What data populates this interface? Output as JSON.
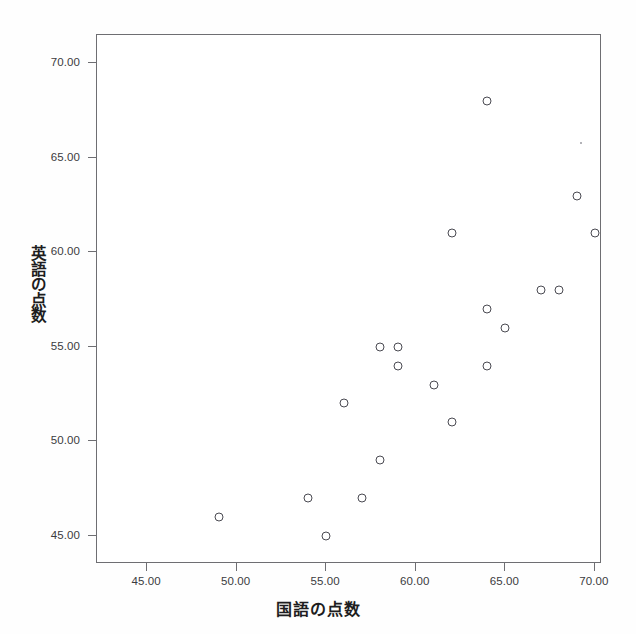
{
  "chart_data": {
    "type": "scatter",
    "title": "",
    "xlabel": "国語の点数",
    "ylabel": "英語の点数",
    "xlim": [
      42.2,
      70.4
    ],
    "ylim": [
      43.5,
      71.5
    ],
    "grid": false,
    "legend": null,
    "xticks": [
      "45.00",
      "50.00",
      "55.00",
      "60.00",
      "65.00",
      "70.00"
    ],
    "xtick_values": [
      45,
      50,
      55,
      60,
      65,
      70
    ],
    "yticks": [
      "45.00",
      "50.00",
      "55.00",
      "60.00",
      "65.00",
      "70.00"
    ],
    "ytick_values": [
      45,
      50,
      55,
      60,
      65,
      70
    ],
    "marker": "open-circle",
    "marker_color": "#4a4a52",
    "points": [
      {
        "x": 49,
        "y": 46
      },
      {
        "x": 54,
        "y": 47
      },
      {
        "x": 55,
        "y": 45
      },
      {
        "x": 56,
        "y": 52
      },
      {
        "x": 57,
        "y": 47
      },
      {
        "x": 58,
        "y": 49
      },
      {
        "x": 58,
        "y": 55
      },
      {
        "x": 59,
        "y": 55
      },
      {
        "x": 59,
        "y": 54
      },
      {
        "x": 61,
        "y": 53
      },
      {
        "x": 62,
        "y": 51
      },
      {
        "x": 62,
        "y": 61
      },
      {
        "x": 64,
        "y": 54
      },
      {
        "x": 64,
        "y": 57
      },
      {
        "x": 64,
        "y": 68
      },
      {
        "x": 65,
        "y": 56
      },
      {
        "x": 67,
        "y": 58
      },
      {
        "x": 68,
        "y": 58
      },
      {
        "x": 69,
        "y": 63
      },
      {
        "x": 70,
        "y": 61
      }
    ]
  },
  "axis_label_chars": {
    "y": [
      "英",
      "語",
      "の",
      "点",
      "数"
    ]
  }
}
